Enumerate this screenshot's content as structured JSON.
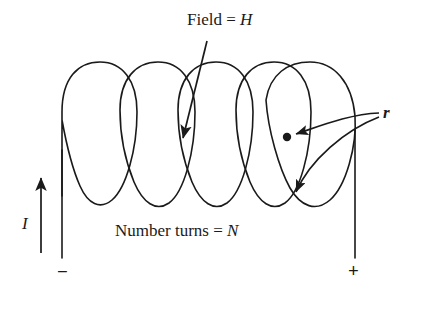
{
  "diagram": {
    "title_text": "Field = H",
    "labels": {
      "field": "Field = ",
      "field_symbol": "H",
      "turns": "Number turns = ",
      "turns_symbol": "N",
      "current_symbol": "I",
      "radius_symbol": "r",
      "terminal_negative": "−",
      "terminal_positive": "+"
    },
    "colors": {
      "ink": "#1a1a1a",
      "background": "#ffffff"
    },
    "geometry": {
      "stroke_width": 1.6,
      "coil_turns": 5,
      "coil_top_y": 62,
      "coil_bottom_y": 206,
      "lead_bottom_y": 258,
      "left_lead_x": 62,
      "right_lead_x": 355,
      "center_dot": {
        "x": 287,
        "y": 137,
        "r": 4.2
      }
    }
  }
}
